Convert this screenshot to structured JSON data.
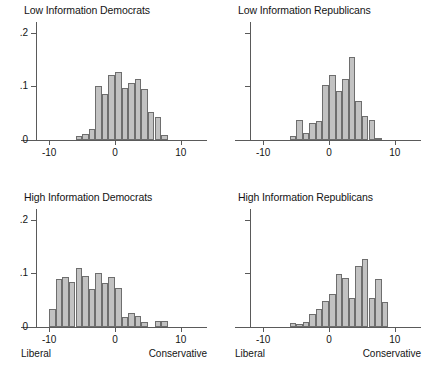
{
  "figure": {
    "background": "#ffffff",
    "bar_fill": "#c2c2c2",
    "bar_edge": "#6e6e6e",
    "axis_color": "#5a5a5a"
  },
  "axis": {
    "y_ticks": [
      "0",
      ".1",
      ".2"
    ],
    "y_tick_values": [
      0,
      0.1,
      0.2
    ],
    "x_ticks": [
      "-10",
      "0",
      "10"
    ],
    "x_tick_values": [
      -10,
      0,
      10
    ],
    "xlim": [
      -12,
      12
    ],
    "ylim": [
      0,
      0.22
    ],
    "left_end_label": "Liberal",
    "right_end_label": "Conservative"
  },
  "chart_data": {
    "type": "bar",
    "title": "",
    "xlabel": "",
    "ylabel": "",
    "grid": false,
    "legend": "none",
    "xlim": [
      -12,
      12
    ],
    "ylim": [
      0,
      0.22
    ],
    "bin_width": 1,
    "panels": [
      {
        "id": "low-information-democrats",
        "title": "Low Information Democrats",
        "show_y_labels": true,
        "show_end_labels": false,
        "bin_centers": [
          -5.5,
          -4.5,
          -3.5,
          -2.5,
          -1.5,
          -0.5,
          0.5,
          1.5,
          2.5,
          3.5,
          4.5,
          5.5,
          6.5,
          7.5
        ],
        "values": [
          0.008,
          0.012,
          0.02,
          0.1,
          0.085,
          0.122,
          0.127,
          0.097,
          0.106,
          0.113,
          0.095,
          0.052,
          0.042,
          0.009
        ]
      },
      {
        "id": "low-information-republicans",
        "title": "Low Information Republicans",
        "show_y_labels": false,
        "show_end_labels": false,
        "bin_centers": [
          -5.5,
          -4.5,
          -3.5,
          -2.5,
          -1.5,
          -0.5,
          0.5,
          1.5,
          2.5,
          3.5,
          4.5,
          5.5,
          6.5,
          7.5
        ],
        "values": [
          0.007,
          0.037,
          0.013,
          0.032,
          0.036,
          0.102,
          0.122,
          0.092,
          0.113,
          0.155,
          0.073,
          0.044,
          0.038,
          0.004
        ]
      },
      {
        "id": "high-information-democrats",
        "title": "High Information Democrats",
        "show_y_labels": true,
        "show_end_labels": true,
        "bin_centers": [
          -9.5,
          -8.5,
          -7.5,
          -6.5,
          -5.5,
          -4.5,
          -3.5,
          -2.5,
          -1.5,
          -0.5,
          0.5,
          1.5,
          2.5,
          3.5,
          4.5,
          6.5,
          7.5
        ],
        "values": [
          0.034,
          0.089,
          0.093,
          0.084,
          0.11,
          0.096,
          0.07,
          0.1,
          0.082,
          0.093,
          0.073,
          0.019,
          0.026,
          0.021,
          0.01,
          0.012,
          0.012
        ]
      },
      {
        "id": "high-information-republicans",
        "title": "High Information Republicans",
        "show_y_labels": false,
        "show_end_labels": true,
        "bin_centers": [
          -5.5,
          -4.5,
          -3.5,
          -2.5,
          -1.5,
          -0.5,
          0.5,
          1.5,
          2.5,
          3.5,
          4.5,
          5.5,
          6.5,
          7.5,
          8.5
        ],
        "values": [
          0.008,
          0.005,
          0.009,
          0.024,
          0.034,
          0.048,
          0.062,
          0.098,
          0.092,
          0.054,
          0.113,
          0.127,
          0.054,
          0.089,
          0.046,
          0.041
        ]
      }
    ]
  }
}
